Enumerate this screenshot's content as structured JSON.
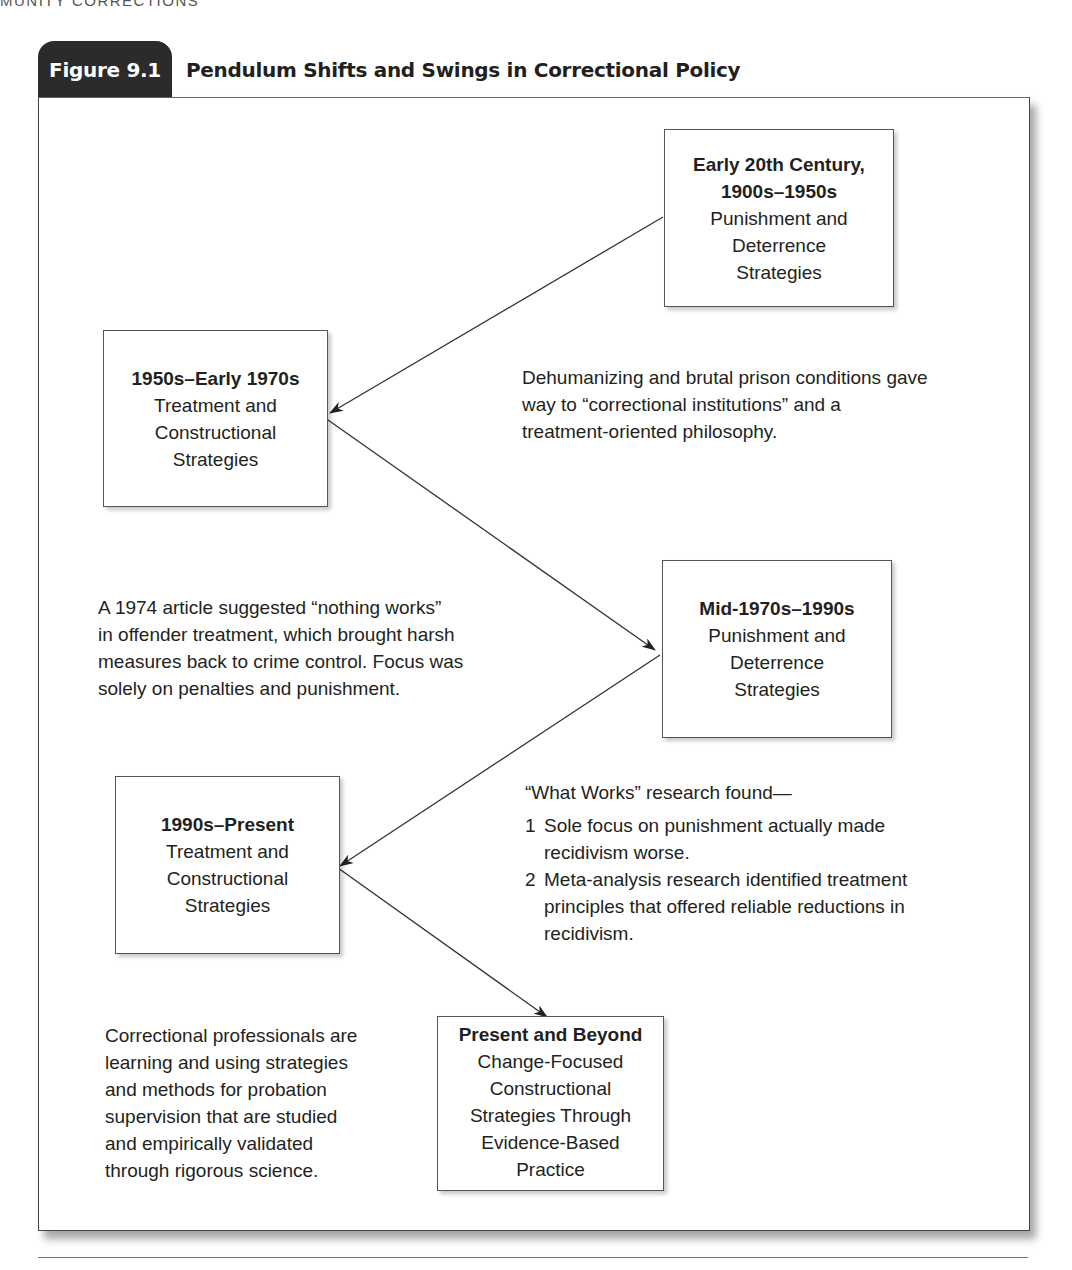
{
  "running_head": "MUNITY CORRECTIONS",
  "figure": {
    "label": "Figure 9.1",
    "title": "Pendulum Shifts and Swings in Correctional Policy"
  },
  "boxes": [
    {
      "id": "early-20th",
      "heading_line1": "Early 20th Century,",
      "heading_line2": "1900s–1950s",
      "body": [
        "Punishment and",
        "Deterrence",
        "Strategies"
      ]
    },
    {
      "id": "1950s-1970s",
      "heading_line1": "1950s–Early 1970s",
      "body": [
        "Treatment and",
        "Constructional",
        "Strategies"
      ]
    },
    {
      "id": "mid1970s-1990s",
      "heading_line1": "Mid-1970s–1990s",
      "body": [
        "Punishment and",
        "Deterrence",
        "Strategies"
      ]
    },
    {
      "id": "1990s-present",
      "heading_line1": "1990s–Present",
      "body": [
        "Treatment and",
        "Constructional",
        "Strategies"
      ]
    },
    {
      "id": "present-beyond",
      "heading_line1": "Present and Beyond",
      "body": [
        "Change-Focused",
        "Constructional",
        "Strategies Through",
        "Evidence-Based",
        "Practice"
      ]
    }
  ],
  "notes": {
    "dehumanizing": [
      "Dehumanizing and brutal prison conditions gave",
      "way to “correctional institutions” and a",
      "treatment-oriented philosophy."
    ],
    "nothing_works": [
      "A 1974 article suggested “nothing works”",
      "in offender treatment, which brought harsh",
      "measures back to crime control. Focus was",
      "solely on penalties and punishment."
    ],
    "what_works": {
      "intro": "“What Works” research found—",
      "items": [
        {
          "num": "1",
          "lines": [
            "Sole focus on punishment actually made",
            "recidivism worse."
          ]
        },
        {
          "num": "2",
          "lines": [
            "Meta-analysis research identified treatment",
            "principles that offered reliable reductions in",
            "recidivism."
          ]
        }
      ]
    },
    "professionals": [
      "Correctional professionals are",
      "learning and using strategies",
      "and methods for probation",
      "supervision that are studied",
      "and empirically validated",
      "through rigorous science."
    ]
  },
  "colors": {
    "tab_bg": "#2b2b2b",
    "text": "#231f20",
    "line": "#333333"
  }
}
